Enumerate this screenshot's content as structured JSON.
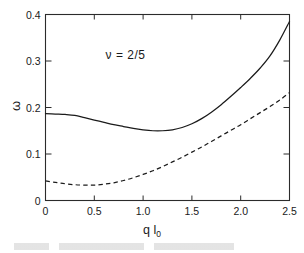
{
  "figure": {
    "name": "dispersion-plot",
    "background": "#ffffff",
    "ink_color": "#1a1a1a"
  },
  "chart_data": {
    "type": "line",
    "title": "",
    "xlabel": "q l0",
    "xlabel_main": "q l",
    "xlabel_sub": "0",
    "ylabel": "ω",
    "xlim": [
      0,
      2.5
    ],
    "ylim": [
      0,
      0.4
    ],
    "grid": false,
    "legend": "none",
    "xticks": [
      0,
      0.5,
      1.0,
      1.5,
      2.0,
      2.5
    ],
    "xticklabels": [
      "0",
      "0.5",
      "1.0",
      "1.5",
      "2.0",
      "2.5"
    ],
    "yticks": [
      0,
      0.1,
      0.2,
      0.3,
      0.4
    ],
    "yticklabels": [
      "0",
      "0.1",
      "0.2",
      "0.3",
      "0.4"
    ],
    "annotations": [
      {
        "text": "ν = 2/5",
        "x": 0.82,
        "y": 0.305
      }
    ],
    "series": [
      {
        "name": "upper-mode-solid",
        "style": "solid",
        "color": "#1b1b1b",
        "x": [
          0.0,
          0.1,
          0.2,
          0.3,
          0.4,
          0.5,
          0.6,
          0.7,
          0.8,
          0.9,
          1.0,
          1.1,
          1.2,
          1.3,
          1.4,
          1.5,
          1.6,
          1.7,
          1.8,
          1.9,
          2.0,
          2.1,
          2.2,
          2.3,
          2.4,
          2.5
        ],
        "y": [
          0.187,
          0.186,
          0.185,
          0.183,
          0.178,
          0.173,
          0.168,
          0.163,
          0.159,
          0.155,
          0.152,
          0.15,
          0.15,
          0.152,
          0.157,
          0.165,
          0.176,
          0.19,
          0.206,
          0.224,
          0.243,
          0.263,
          0.285,
          0.311,
          0.345,
          0.385
        ]
      },
      {
        "name": "lower-mode-dashed",
        "style": "dashed",
        "color": "#1b1b1b",
        "x": [
          0.0,
          0.1,
          0.2,
          0.3,
          0.4,
          0.5,
          0.6,
          0.7,
          0.8,
          0.9,
          1.0,
          1.1,
          1.2,
          1.3,
          1.4,
          1.5,
          1.6,
          1.7,
          1.8,
          1.9,
          2.0,
          2.1,
          2.2,
          2.3,
          2.4,
          2.5
        ],
        "y": [
          0.042,
          0.039,
          0.036,
          0.034,
          0.033,
          0.033,
          0.035,
          0.038,
          0.043,
          0.049,
          0.056,
          0.064,
          0.073,
          0.083,
          0.093,
          0.104,
          0.115,
          0.127,
          0.139,
          0.151,
          0.163,
          0.176,
          0.189,
          0.202,
          0.216,
          0.232
        ]
      }
    ]
  }
}
